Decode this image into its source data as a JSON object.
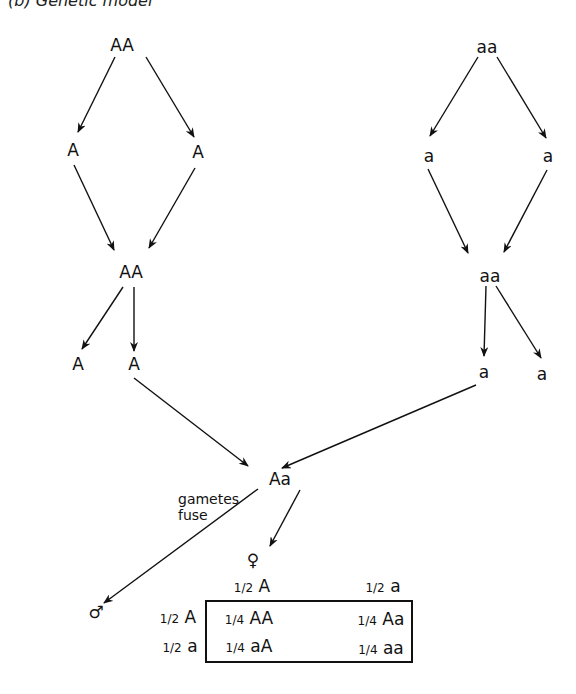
{
  "title": "(b) Genetic model",
  "left_lineage": {
    "parent": "AA",
    "gametes_1": [
      "A",
      "A"
    ],
    "offspring": "AA",
    "gametes_2": [
      "A",
      "A"
    ]
  },
  "right_lineage": {
    "parent": "aa",
    "gametes_1": [
      "a",
      "a"
    ],
    "offspring": "aa",
    "gametes_2": [
      "a",
      "a"
    ]
  },
  "hybrid": "Aa",
  "gametes_label": [
    "gametes",
    "fuse"
  ],
  "female_symbol": "♀",
  "male_symbol": "♂",
  "punnett": {
    "col_headers": [
      {
        "frac": "1/2",
        "allele": "A"
      },
      {
        "frac": "1/2",
        "allele": "a"
      }
    ],
    "row_headers": [
      {
        "frac": "1/2",
        "allele": "A"
      },
      {
        "frac": "1/2",
        "allele": "a"
      }
    ],
    "cells": [
      [
        {
          "frac": "1/4",
          "genotype": "AA"
        },
        {
          "frac": "1/4",
          "genotype": "Aa"
        }
      ],
      [
        {
          "frac": "1/4",
          "genotype": "aA"
        },
        {
          "frac": "1/4",
          "genotype": "aa"
        }
      ]
    ]
  }
}
